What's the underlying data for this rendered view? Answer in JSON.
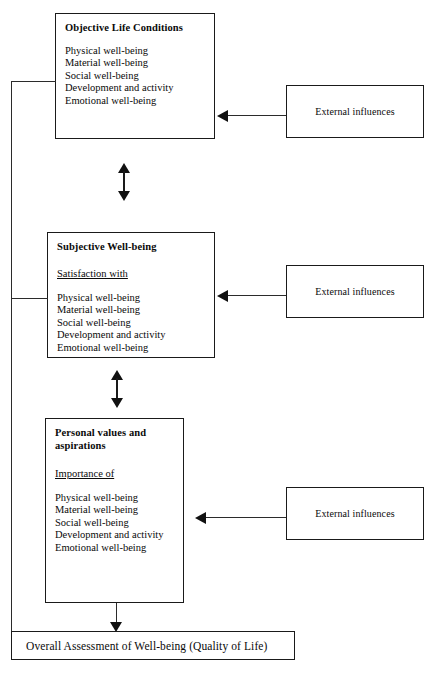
{
  "diagram": {
    "boxes": [
      {
        "id": "objective-life-conditions",
        "title": "Objective Life Conditions",
        "subtitle": "",
        "items": [
          "Physical well-being",
          "Material well-being",
          "Social well-being",
          "Development and activity",
          "Emotional well-being"
        ]
      },
      {
        "id": "subjective-well-being",
        "title": "Subjective Well-being",
        "subtitle": "Satisfaction with",
        "items": [
          "Physical well-being",
          "Material well-being",
          "Social well-being",
          "Development and activity",
          "Emotional well-being"
        ]
      },
      {
        "id": "personal-values-and-aspirations",
        "title": "Personal values and aspirations",
        "subtitle": "Importance of",
        "items": [
          "Physical well-being",
          "Material well-being",
          "Social well-being",
          "Development and activity",
          "Emotional well-being"
        ]
      }
    ],
    "external_boxes": [
      {
        "id": "external-influences-1",
        "label": "External influences"
      },
      {
        "id": "external-influences-2",
        "label": "External influences"
      },
      {
        "id": "external-influences-3",
        "label": "External influences"
      }
    ],
    "summary": {
      "id": "overall-assessment",
      "label": "Overall Assessment of Well-being (Quality of Life)"
    },
    "connectors": {
      "double_arrow_1": "bidirectional link between Objective Life Conditions and Subjective Well-being",
      "double_arrow_2": "bidirectional link between Subjective Well-being and Personal values and aspirations",
      "feedback_line": "feedback loop from Subjective Well-being down and around to Objective Life Conditions",
      "summary_arrow": "arrow from Personal values and aspirations down to Overall Assessment"
    },
    "colors": {
      "stroke": "#1a1a1a",
      "background": "#ffffff",
      "text": "#0a0a0a"
    }
  },
  "caption": {
    "text": ""
  }
}
